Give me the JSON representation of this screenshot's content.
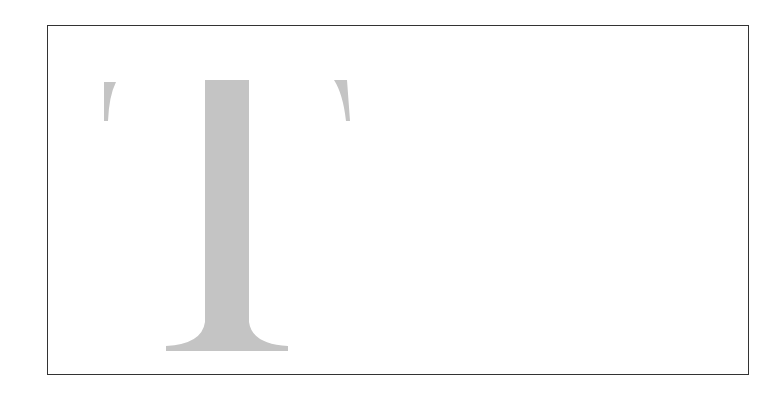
{
  "figure": {
    "glyph": "T",
    "glyph_color": "#c4c4c4",
    "frame_color": "#333333",
    "background": "#ffffff"
  }
}
